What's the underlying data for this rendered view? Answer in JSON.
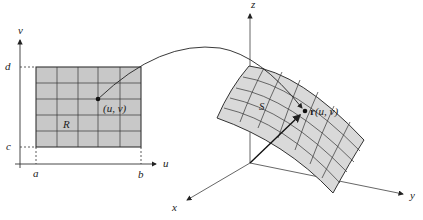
{
  "diagram": {
    "domain": {
      "axis_labels": {
        "vertical": "v",
        "horizontal": "u"
      },
      "bounds_labels": {
        "a": "a",
        "b": "b",
        "c": "c",
        "d": "d"
      },
      "region_label": "R",
      "point_label": "(u, v)",
      "grid": {
        "columns": 5,
        "rows": 5
      }
    },
    "surface": {
      "axis_labels": {
        "z": "z",
        "y": "y",
        "x": "x"
      },
      "surface_label": "S",
      "point_label_bold": "r",
      "point_label_args": "(u, v)"
    },
    "colors": {
      "region_fill": "#c8c8c8",
      "surface_fill": "#d9d9d9",
      "line": "#333333",
      "axis": "#555555"
    }
  }
}
